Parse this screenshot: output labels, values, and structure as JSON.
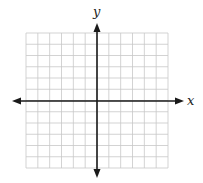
{
  "diagram": {
    "type": "coordinate-plane",
    "x_axis_label": "x",
    "y_axis_label": "y",
    "grid": {
      "columns": 12,
      "rows": 12,
      "left": 26,
      "right": 168,
      "top": 33,
      "bottom": 168
    },
    "origin": {
      "x": 97,
      "y": 101
    },
    "colors": {
      "grid": "#c8c8c8",
      "axis": "#1a1a1a",
      "background": "#ffffff"
    }
  }
}
